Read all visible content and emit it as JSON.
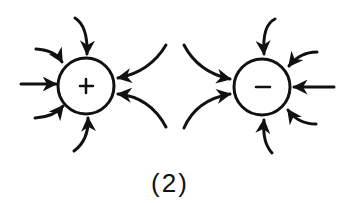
{
  "diagram": {
    "caption": "(2)",
    "charges": [
      {
        "id": "positive",
        "symbol": "+",
        "cx": 86,
        "cy": 86,
        "r": 28
      },
      {
        "id": "negative",
        "symbol": "−",
        "cx": 262,
        "cy": 87,
        "r": 28
      }
    ],
    "colors": {
      "stroke": "#111111",
      "background": "#ffffff"
    }
  }
}
